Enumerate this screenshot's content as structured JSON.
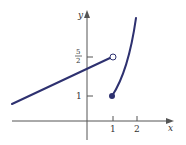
{
  "figure": {
    "type": "piecewise-function-graph",
    "axes": {
      "x_label": "x",
      "y_label": "y",
      "x_ticks": [
        {
          "value": 1,
          "label": "1"
        },
        {
          "value": 2,
          "label": "2"
        }
      ],
      "y_ticks": [
        {
          "value": 1,
          "label": "1"
        },
        {
          "value": 2.5,
          "label_num": "5",
          "label_den": "2"
        }
      ]
    },
    "pieces": [
      {
        "kind": "line",
        "domain": "x < 1",
        "approaches": {
          "x": 1,
          "y": 2.5
        },
        "endpoint": "open-circle"
      },
      {
        "kind": "increasing-curve",
        "domain": "x >= 1",
        "start": {
          "x": 1,
          "y": 1
        },
        "endpoint": "filled-dot"
      }
    ],
    "colors": {
      "curve": "#2e3170",
      "axis": "#555555"
    }
  }
}
